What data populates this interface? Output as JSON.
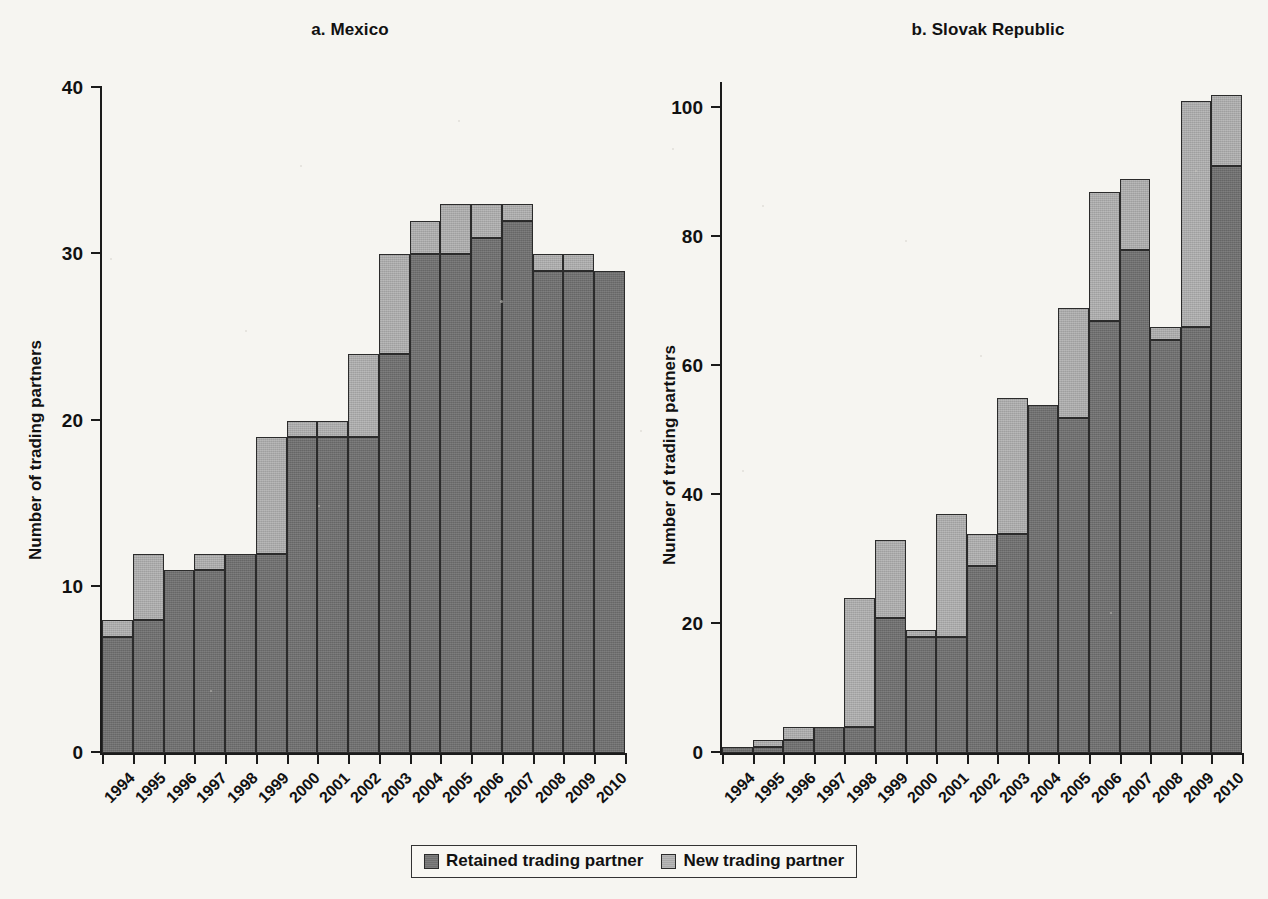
{
  "figure": {
    "background_color": "#f6f5f1",
    "retained_color": "#6f6f6f",
    "new_color": "#a9a9a9"
  },
  "legend": {
    "items": [
      {
        "label": "Retained trading partner",
        "key": "retained",
        "color": "#6f6f6f"
      },
      {
        "label": "New trading partner",
        "key": "new",
        "color": "#a9a9a9"
      }
    ]
  },
  "panels": [
    {
      "id": "a",
      "title": "a. Mexico",
      "ylabel": "Number of trading partners"
    },
    {
      "id": "b",
      "title": "b. Slovak Republic",
      "ylabel": "Number of trading partners"
    }
  ],
  "chart_data": [
    {
      "type": "bar",
      "stacked": true,
      "title": "a. Mexico",
      "xlabel": "",
      "ylabel": "Number of trading partners",
      "ylim": [
        0,
        40
      ],
      "yticks": [
        0,
        10,
        20,
        30,
        40
      ],
      "ytick_labels": [
        "0",
        "10",
        "20",
        "30",
        "40"
      ],
      "grid": false,
      "legend_position": "bottom-center-shared",
      "categories": [
        "1994",
        "1995",
        "1996",
        "1997",
        "1998",
        "1999",
        "2000",
        "2001",
        "2002",
        "2003",
        "2004",
        "2005",
        "2006",
        "2007",
        "2008",
        "2009",
        "2010"
      ],
      "series": [
        {
          "name": "Retained trading partner",
          "values": [
            7,
            8,
            11,
            11,
            12,
            12,
            19,
            19,
            19,
            24,
            30,
            30,
            31,
            32,
            29,
            29,
            29
          ]
        },
        {
          "name": "New trading partner",
          "values": [
            1,
            4,
            0,
            1,
            0,
            7,
            1,
            1,
            5,
            6,
            2,
            3,
            2,
            1,
            1,
            1,
            0
          ]
        }
      ],
      "totals": [
        8,
        12,
        11,
        12,
        12,
        19,
        20,
        20,
        24,
        30,
        32,
        33,
        33,
        33,
        30,
        30,
        29
      ]
    },
    {
      "type": "bar",
      "stacked": true,
      "title": "b. Slovak Republic",
      "xlabel": "",
      "ylabel": "Number of trading partners",
      "ylim": [
        0,
        104
      ],
      "yticks": [
        0,
        20,
        40,
        60,
        80,
        100
      ],
      "ytick_labels": [
        "0",
        "20",
        "40",
        "60",
        "80",
        "100"
      ],
      "grid": false,
      "legend_position": "bottom-center-shared",
      "categories": [
        "1994",
        "1995",
        "1996",
        "1997",
        "1998",
        "1999",
        "2000",
        "2001",
        "2002",
        "2003",
        "2004",
        "2005",
        "2006",
        "2007",
        "2008",
        "2009",
        "2010"
      ],
      "series": [
        {
          "name": "Retained trading partner",
          "values": [
            1,
            1,
            2,
            4,
            4,
            21,
            18,
            18,
            29,
            34,
            54,
            52,
            67,
            78,
            64,
            66,
            91
          ]
        },
        {
          "name": "New trading partner",
          "values": [
            0,
            1,
            2,
            0,
            20,
            12,
            1,
            19,
            5,
            21,
            0,
            17,
            20,
            11,
            2,
            35,
            11
          ]
        }
      ],
      "totals": [
        1,
        2,
        4,
        4,
        24,
        33,
        19,
        37,
        34,
        55,
        54,
        69,
        87,
        89,
        66,
        101,
        102
      ]
    }
  ]
}
